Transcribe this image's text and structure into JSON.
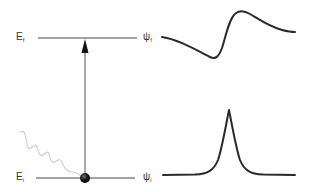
{
  "diagram": {
    "type": "energy-level-transition",
    "levels": [
      {
        "id": "final",
        "energy_label": "E",
        "energy_sub": "f",
        "wavefunction_label": "ψ",
        "wavefunction_sub": "f",
        "y": 38,
        "curve": "dispersive / derivative-shaped lineshape"
      },
      {
        "id": "initial",
        "energy_label": "E",
        "energy_sub": "i",
        "wavefunction_label": "ψ",
        "wavefunction_sub": "i",
        "y": 178,
        "curve": "sharp cusp peak (Lorentzian-like)"
      }
    ],
    "transition": {
      "from": "initial",
      "to": "final",
      "style": "upward arrow"
    },
    "excitation": {
      "style": "wavy line (photon)",
      "color": "#cccccc"
    },
    "particle": {
      "style": "filled dark sphere",
      "color": "#1a1a1a"
    },
    "colors": {
      "level_line": "#333333",
      "curve": "#2a2a2a",
      "label": "#333333",
      "photon": "#cccccc"
    }
  }
}
